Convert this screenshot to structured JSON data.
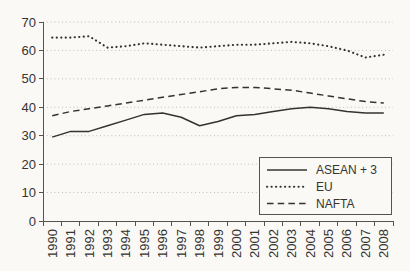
{
  "figure": {
    "width": 410,
    "height": 271,
    "background": "#faf9f6",
    "line_color": "#34332f",
    "grid_color": "#bdbcb6",
    "axis_color": "#55544f",
    "text_color": "#353431"
  },
  "chart_data": {
    "type": "line",
    "title": "",
    "xlabel": "",
    "ylabel": "",
    "x": [
      "1990",
      "1991",
      "1992",
      "1993",
      "1994",
      "1995",
      "1996",
      "1997",
      "1998",
      "1999",
      "2000",
      "2001",
      "2002",
      "2003",
      "2004",
      "2005",
      "2006",
      "2007",
      "2008"
    ],
    "series": [
      {
        "name": "ASEAN + 3",
        "line_style": "solid",
        "values": [
          29.5,
          31.5,
          31.5,
          33.5,
          35.5,
          37.5,
          38,
          36.5,
          33.5,
          35,
          37,
          37.5,
          38.5,
          39.5,
          40,
          39.5,
          38.5,
          38,
          38
        ]
      },
      {
        "name": "EU",
        "line_style": "dotted",
        "values": [
          64.5,
          64.5,
          65,
          61,
          61.5,
          62.5,
          62,
          61.5,
          61,
          61.5,
          62,
          62,
          62.5,
          63,
          62.5,
          61.5,
          60,
          57.5,
          58.5
        ]
      },
      {
        "name": "NAFTA",
        "line_style": "dashed",
        "values": [
          37,
          38.5,
          39.5,
          40.5,
          41.5,
          42.5,
          43.5,
          44.5,
          45.5,
          46.5,
          47,
          47,
          46.5,
          46,
          45,
          44,
          43,
          42,
          41.5
        ]
      }
    ],
    "ylim": [
      0,
      70
    ],
    "ytick_step": 10,
    "grid": "horizontal dotted gridlines",
    "legend_position": "inside bottom-right",
    "legend_labels": [
      "ASEAN + 3",
      "EU",
      "NAFTA"
    ]
  }
}
